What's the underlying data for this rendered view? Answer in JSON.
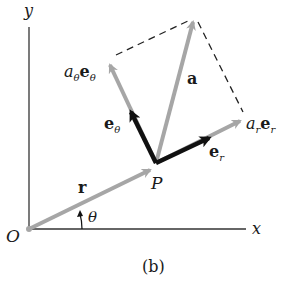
{
  "diagram": {
    "caption": "(b)",
    "axes": {
      "x_label": "x",
      "y_label": "y",
      "origin_label": "O"
    },
    "point_label": "P",
    "angle_label": "θ",
    "vectors": {
      "r": {
        "label": "r"
      },
      "a": {
        "label": "a"
      },
      "radial_component": {
        "coef": "a",
        "coef_sub": "r",
        "unit": "e",
        "unit_sub": "r"
      },
      "transverse_component": {
        "coef": "a",
        "coef_sub": "θ",
        "unit": "e",
        "unit_sub": "θ"
      },
      "e_r": {
        "unit": "e",
        "unit_sub": "r"
      },
      "e_theta": {
        "unit": "e",
        "unit_sub": "θ"
      }
    },
    "colors": {
      "axis": "#333333",
      "gray_vector": "#a6a6a6",
      "unit_vector": "#111111",
      "dashed": "#222222",
      "text": "#1a1a1a"
    }
  }
}
